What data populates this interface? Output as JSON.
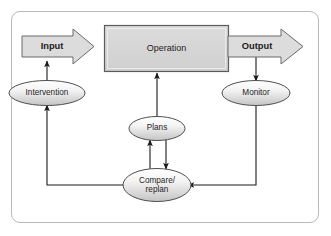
{
  "diagram": {
    "frame": {
      "border_color": "#b9b9b9",
      "background": "#ffffff"
    },
    "palette": {
      "box_fill": "#d2d2d2",
      "box_stroke": "#5b5b5b",
      "arrow_fill": "#dcdcdc",
      "arrow_stroke": "#6a6a6a",
      "ellipse_fill_top": "#fcfcfc",
      "ellipse_fill_bottom": "#c9c9c9",
      "ellipse_stroke": "#4f4f4f",
      "connector_stroke": "#1a1a1a",
      "text_color": "#1d1d1d"
    },
    "nodes": [
      {
        "id": "input",
        "shape": "block-arrow",
        "label": "Input",
        "bold": true
      },
      {
        "id": "operation",
        "shape": "rectangle",
        "label": "Operation",
        "bold": false
      },
      {
        "id": "output",
        "shape": "block-arrow",
        "label": "Output",
        "bold": true
      },
      {
        "id": "intervention",
        "shape": "ellipse",
        "label": "Intervention",
        "bold": false
      },
      {
        "id": "monitor",
        "shape": "ellipse",
        "label": "Monitor",
        "bold": false
      },
      {
        "id": "plans",
        "shape": "ellipse",
        "label": "Plans",
        "bold": false
      },
      {
        "id": "compare",
        "shape": "ellipse",
        "label": "Compare/\nreplan",
        "bold": false
      }
    ],
    "connectors": [
      {
        "id": "intervention-to-input",
        "from": "intervention",
        "to": "input",
        "arrowhead": "to"
      },
      {
        "id": "plans-to-operation",
        "from": "plans",
        "to": "operation",
        "arrowhead": "to"
      },
      {
        "id": "output-to-monitor",
        "from": "output",
        "to": "monitor",
        "arrowhead": "to"
      },
      {
        "id": "monitor-to-compare",
        "from": "monitor",
        "to": "compare",
        "arrowhead": "to"
      },
      {
        "id": "compare-to-plans",
        "from": "compare",
        "to": "plans",
        "arrowhead": "to"
      },
      {
        "id": "plans-to-compare",
        "from": "plans",
        "to": "compare",
        "arrowhead": "to"
      },
      {
        "id": "compare-to-intervention",
        "from": "compare",
        "to": "intervention",
        "arrowhead": "to"
      }
    ]
  }
}
